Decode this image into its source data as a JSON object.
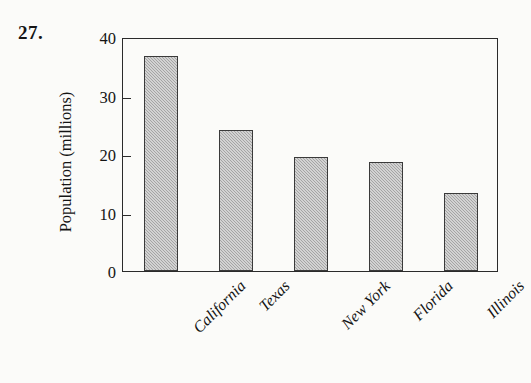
{
  "problem": {
    "number": "27."
  },
  "chart_data": {
    "type": "bar",
    "title": "",
    "xlabel": "",
    "ylabel": "Population (millions)",
    "categories": [
      "California",
      "Texas",
      "New York",
      "Florida",
      "Illinois"
    ],
    "values": [
      36.8,
      24.1,
      19.5,
      18.6,
      13.3
    ],
    "ylim": [
      0,
      40
    ],
    "yticks": [
      0,
      10,
      20,
      30,
      40
    ],
    "ytick_labels": [
      "0",
      "10",
      "20",
      "30",
      "40"
    ],
    "grid": false,
    "legend": false,
    "bar_fill_color": "#b4b4b4",
    "bar_edge_color": "#3a3a3a",
    "axis_color": "#2b2b2b"
  }
}
